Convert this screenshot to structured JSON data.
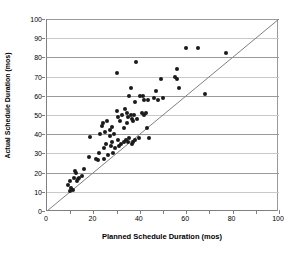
{
  "chart_data": {
    "type": "scatter",
    "title": "",
    "xlabel": "Planned Schedule Duration (mos)",
    "ylabel": "Actual Schedule Duration (mos)",
    "xlim": [
      0,
      100
    ],
    "ylim": [
      0,
      100
    ],
    "xticks": [
      0,
      20,
      40,
      60,
      80,
      100
    ],
    "xtick_labels": [
      "0",
      "20",
      "40",
      "60",
      "80",
      "100"
    ],
    "xminor_ticks": [
      10,
      30,
      50,
      70,
      90
    ],
    "yticks": [
      0,
      10,
      20,
      30,
      40,
      50,
      60,
      70,
      80,
      90,
      100
    ],
    "ytick_labels": [
      "0",
      "10",
      "20",
      "30",
      "40",
      "50",
      "60",
      "70",
      "80",
      "90",
      "100"
    ],
    "grid": "horizontal",
    "legend": "none",
    "marker_color": "#1a1a1a",
    "gridline_color": "#9a9a9a",
    "reference_line": {
      "name": "y = x parity line",
      "from": [
        0,
        0
      ],
      "to": [
        100,
        100
      ],
      "color": "#808080"
    },
    "series": [
      {
        "name": "Projects",
        "points": [
          [
            9,
            13.5
          ],
          [
            10,
            15.5
          ],
          [
            10,
            10.5
          ],
          [
            10.5,
            12
          ],
          [
            11,
            11
          ],
          [
            11.5,
            17
          ],
          [
            12,
            21
          ],
          [
            12.5,
            20
          ],
          [
            13,
            15.5
          ],
          [
            13.5,
            16.5
          ],
          [
            14,
            17
          ],
          [
            15,
            18
          ],
          [
            16,
            22
          ],
          [
            18,
            28
          ],
          [
            18.5,
            38.5
          ],
          [
            21,
            27
          ],
          [
            22,
            26.5
          ],
          [
            22.5,
            30
          ],
          [
            23,
            40
          ],
          [
            23.5,
            44.5
          ],
          [
            24,
            46
          ],
          [
            24.5,
            27
          ],
          [
            24.5,
            33
          ],
          [
            25,
            41
          ],
          [
            25.5,
            35
          ],
          [
            26,
            47
          ],
          [
            26.5,
            29
          ],
          [
            27,
            39
          ],
          [
            27,
            42
          ],
          [
            27.5,
            34
          ],
          [
            28,
            36
          ],
          [
            28,
            44
          ],
          [
            28.5,
            30
          ],
          [
            29,
            40
          ],
          [
            29.5,
            33
          ],
          [
            30,
            52
          ],
          [
            30,
            72
          ],
          [
            30.5,
            37
          ],
          [
            30.5,
            49
          ],
          [
            31,
            34
          ],
          [
            31.5,
            47
          ],
          [
            32,
            35
          ],
          [
            32.5,
            50
          ],
          [
            33,
            36
          ],
          [
            33,
            43
          ],
          [
            33.5,
            53
          ],
          [
            34,
            37
          ],
          [
            34.5,
            46
          ],
          [
            34.5,
            51
          ],
          [
            35,
            36
          ],
          [
            35,
            49
          ],
          [
            35.5,
            60
          ],
          [
            35.5,
            38
          ],
          [
            36,
            50
          ],
          [
            36,
            64
          ],
          [
            36.5,
            48
          ],
          [
            36.5,
            35
          ],
          [
            37,
            47
          ],
          [
            37,
            36
          ],
          [
            37.5,
            50
          ],
          [
            38,
            37
          ],
          [
            38,
            57
          ],
          [
            38.5,
            77.5
          ],
          [
            39,
            48
          ],
          [
            39.5,
            38
          ],
          [
            40,
            60
          ],
          [
            41,
            51
          ],
          [
            41.5,
            60
          ],
          [
            42,
            50
          ],
          [
            42,
            58
          ],
          [
            42.5,
            51
          ],
          [
            43,
            43
          ],
          [
            43.5,
            58
          ],
          [
            44,
            38
          ],
          [
            46,
            59
          ],
          [
            47,
            62.5
          ],
          [
            48,
            58
          ],
          [
            49,
            69
          ],
          [
            50,
            59
          ],
          [
            55,
            70
          ],
          [
            56,
            74
          ],
          [
            56,
            69
          ],
          [
            57,
            64
          ],
          [
            60,
            85
          ],
          [
            65,
            85
          ],
          [
            68,
            61
          ],
          [
            77,
            82.5
          ]
        ]
      }
    ]
  }
}
